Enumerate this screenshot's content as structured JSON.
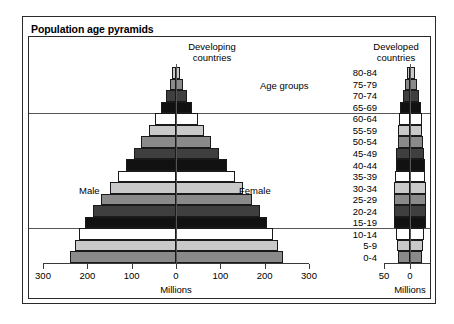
{
  "figure": {
    "title": "Population age pyramids",
    "panels": {
      "left_heading": "Developing\ncountries",
      "right_heading": "Developed\ncountries"
    },
    "age_groups_header": "Age groups",
    "sex_labels": {
      "male": "Male",
      "female": "Female"
    },
    "axis_caption_left": "Millions",
    "axis_caption_right": "Millions",
    "colors": {
      "frame": "#2a2a2a",
      "bar_outline": "#1a1a1a",
      "reference_line": "#555555",
      "shade_white": "#ffffff",
      "shade_light": "#c9c9c9",
      "shade_medium": "#8a8a8a",
      "shade_dark": "#3f3f3f",
      "shade_black": "#111111"
    }
  },
  "chart_data": {
    "type": "bar",
    "title": "Population age pyramids",
    "subtype": "population-pyramid",
    "xlabel": "Millions",
    "ylabel": "Age groups",
    "categories": [
      "80-84",
      "75-79",
      "70-74",
      "65-69",
      "60-64",
      "55-59",
      "50-54",
      "45-49",
      "40-44",
      "35-39",
      "30-34",
      "25-29",
      "20-24",
      "15-19",
      "10-14",
      "5-9",
      "0-4"
    ],
    "shades": [
      "light",
      "medium",
      "dark",
      "black",
      "white",
      "light",
      "medium",
      "dark",
      "black",
      "white",
      "light",
      "medium",
      "dark",
      "black",
      "white",
      "light",
      "medium"
    ],
    "panels": [
      {
        "name": "Developing countries",
        "xlim": [
          -300,
          300
        ],
        "ticks": [
          300,
          200,
          100,
          0,
          100,
          200,
          300
        ],
        "tick_labels": [
          "300",
          "200",
          "100",
          "0",
          "100",
          "200",
          "300"
        ],
        "series": [
          {
            "name": "Male",
            "side": "left",
            "values": [
              8,
              14,
              22,
              33,
              48,
              62,
              78,
              95,
              112,
              130,
              150,
              170,
              188,
              205,
              218,
              228,
              240
            ]
          },
          {
            "name": "Female",
            "side": "right",
            "values": [
              10,
              16,
              24,
              35,
              50,
              64,
              80,
              97,
              114,
              132,
              152,
              172,
              190,
              206,
              219,
              229,
              241
            ]
          }
        ]
      },
      {
        "name": "Developed countries",
        "xlim": [
          -50,
          50
        ],
        "ticks": [
          50,
          0,
          50
        ],
        "tick_labels": [
          "50",
          "0",
          "50"
        ],
        "series": [
          {
            "name": "Male",
            "side": "left",
            "values": [
              6,
              10,
              14,
              19,
              22,
              23,
              24,
              26,
              27,
              28,
              30,
              31,
              31,
              30,
              27,
              25,
              24
            ]
          },
          {
            "name": "Female",
            "side": "right",
            "values": [
              9,
              13,
              17,
              21,
              23,
              24,
              25,
              27,
              28,
              29,
              30,
              31,
              31,
              30,
              27,
              25,
              24
            ]
          }
        ]
      }
    ],
    "reference_lines": [
      {
        "between": "65-69 / 60-64",
        "note": "horizontal rule across plot"
      },
      {
        "between": "15-19 / 10-14",
        "note": "horizontal rule across plot"
      }
    ],
    "grid": false,
    "legend": null
  }
}
